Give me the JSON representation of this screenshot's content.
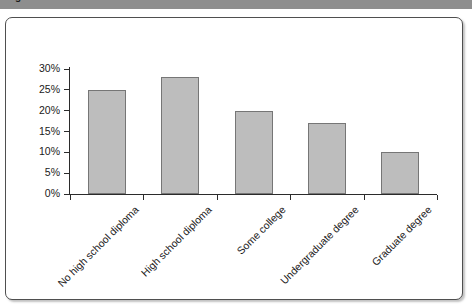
{
  "figure": {
    "caption": "Figure 12   Level of Parent Education"
  },
  "chart_data": {
    "type": "bar",
    "title": "",
    "xlabel": "",
    "ylabel": "",
    "categories": [
      "No high school diploma",
      "High school diploma",
      "Some college",
      "Undergraduate degree",
      "Graduate degree"
    ],
    "values": [
      25,
      28,
      20,
      17,
      10
    ],
    "value_labels": [
      "25%",
      "28%",
      "20%",
      "17%",
      "10%"
    ],
    "ylim": [
      0,
      30
    ],
    "ytick_values": [
      0,
      5,
      10,
      15,
      20,
      25,
      30
    ],
    "ytick_labels": [
      "0%",
      "5%",
      "10%",
      "15%",
      "20%",
      "25%",
      "30%"
    ],
    "grid": false,
    "legend": null,
    "series": [
      {
        "name": "Level of parent education",
        "values": [
          25,
          28,
          20,
          17,
          10
        ]
      }
    ],
    "colors": {
      "bar_fill": "#bdbdbd",
      "bar_border": "#767676",
      "axis": "#2b2b2b",
      "text": "#1a1a1a",
      "card_background": "#ffffff",
      "card_border": "#4f4f4f",
      "caption_strip": "#8e8e8e"
    }
  }
}
